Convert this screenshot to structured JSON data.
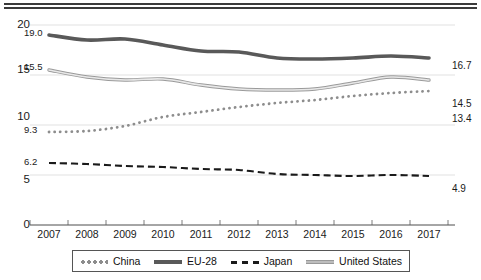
{
  "chart_data": {
    "type": "line",
    "title": "",
    "subtitle": "",
    "xlabel": "",
    "ylabel": "",
    "categories": [
      "2007",
      "2008",
      "2009",
      "2010",
      "2011",
      "2012",
      "2013",
      "2014",
      "2015",
      "2016",
      "2017"
    ],
    "ylim": [
      0,
      20
    ],
    "yticks": [
      "0",
      "5",
      "10",
      "15",
      "20"
    ],
    "grid": true,
    "legend_position": "bottom",
    "series": [
      {
        "name": "China",
        "style": "dotted",
        "color": "#8d8d8d",
        "values": [
          9.3,
          9.4,
          9.9,
          10.8,
          11.3,
          11.8,
          12.2,
          12.5,
          12.9,
          13.2,
          13.4
        ],
        "start_label": "9.3",
        "end_label": "13.4"
      },
      {
        "name": "EU-28",
        "style": "thick-solid",
        "color": "#595959",
        "values": [
          19.0,
          18.5,
          18.6,
          18.0,
          17.4,
          17.3,
          16.7,
          16.6,
          16.7,
          16.9,
          16.7
        ],
        "start_label": "19.0",
        "end_label": "16.7"
      },
      {
        "name": "Japan",
        "style": "dashed",
        "color": "#1a1a1a",
        "values": [
          6.2,
          6.1,
          5.9,
          5.8,
          5.6,
          5.5,
          5.1,
          5.0,
          4.9,
          5.0,
          4.9
        ],
        "start_label": "6.2",
        "end_label": "4.9"
      },
      {
        "name": "United States",
        "style": "thin-light-solid",
        "color": "#b3b3b3",
        "values": [
          15.5,
          14.8,
          14.5,
          14.6,
          14.0,
          13.6,
          13.5,
          13.6,
          14.2,
          14.8,
          14.5
        ],
        "start_label": "15.5",
        "end_label": "14.5"
      }
    ]
  },
  "legend": {
    "items": [
      {
        "label": "China"
      },
      {
        "label": "EU-28"
      },
      {
        "label": "Japan"
      },
      {
        "label": "United States"
      }
    ]
  },
  "axes": {
    "y": {
      "ticks": [
        "20",
        "15",
        "10",
        "5",
        "0"
      ]
    },
    "x": {
      "ticks": [
        "2007",
        "2008",
        "2009",
        "2010",
        "2011",
        "2012",
        "2013",
        "2014",
        "2015",
        "2016",
        "2017"
      ]
    }
  },
  "annotations": {
    "start": {
      "eu28": "19.0",
      "us": "15.5",
      "china": "9.3",
      "japan": "6.2"
    },
    "end": {
      "eu28": "16.7",
      "us": "14.5",
      "china": "13.4",
      "japan": "4.9"
    }
  }
}
